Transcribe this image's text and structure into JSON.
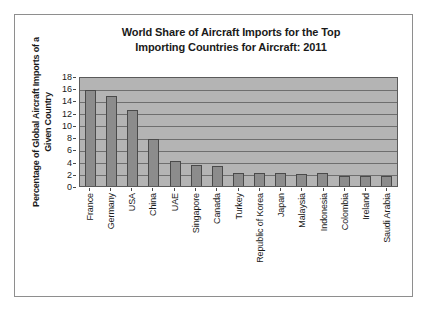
{
  "chart_data": {
    "type": "bar",
    "title": "World Share of Aircraft Imports for the Top Importing Countries for Aircraft: 2011",
    "title_lines": [
      "World Share of Aircraft Imports for the Top",
      "Importing Countries for Aircraft: 2011"
    ],
    "xlabel": "",
    "ylabel": "Percentage of Global Aircraft Imports of a Given Country",
    "ylabel_lines": [
      "Percentage of Global Aircraft Imports of a",
      "Given Country"
    ],
    "categories": [
      "France",
      "Germany",
      "USA",
      "China",
      "UAE",
      "Singapore",
      "Canada",
      "Turkey",
      "Republic of Korea",
      "Japan",
      "Malaysia",
      "Indonesia",
      "Colombia",
      "Ireland",
      "Saudi Arabia"
    ],
    "values": [
      15.7,
      14.7,
      12.5,
      7.7,
      4.1,
      3.5,
      3.2,
      2.1,
      2.15,
      2.1,
      2.0,
      2.05,
      1.65,
      1.65,
      1.6
    ],
    "ylim": [
      0,
      18
    ],
    "ytick_values": [
      0,
      2,
      4,
      6,
      8,
      10,
      12,
      14,
      16,
      18
    ],
    "ytick_labels": [
      "0",
      "2",
      "4",
      "6",
      "8",
      "10",
      "12",
      "14",
      "16",
      "18"
    ],
    "grid": true,
    "grid_axis": "y",
    "legend": false,
    "legend_position": "none",
    "colors": {
      "bar_fill": "#8c8c8c",
      "bar_edge": "#4a4a4a",
      "plot_background": "#b4b4b4",
      "gridline": "#6e6e6e",
      "figure_background": "#ffffff",
      "frame_border": "#8e8e8e",
      "text": "#1a1a1a"
    }
  }
}
